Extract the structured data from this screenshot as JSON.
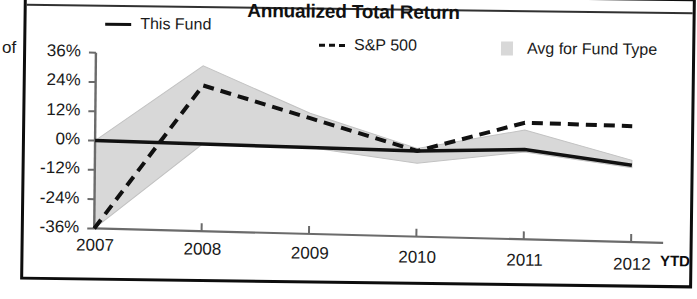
{
  "page": {
    "edge_fragment_text": "of"
  },
  "chart_data": {
    "type": "line",
    "title": "Annualized Total Return",
    "xlabel": "",
    "ylabel": "",
    "grid": false,
    "legend_position": "top",
    "categories": [
      "2007",
      "2008",
      "2009",
      "2010",
      "2011",
      "2012"
    ],
    "x_tick_suffix_label": "YTD",
    "ytick_labels": [
      "36%",
      "24%",
      "12%",
      "0%",
      "-12%",
      "-24%",
      "-36%"
    ],
    "ytick_values": [
      36,
      24,
      12,
      0,
      -12,
      -24,
      -36
    ],
    "ylim": [
      -36,
      36
    ],
    "series": [
      {
        "name": "This Fund",
        "style": "solid",
        "color": "#111111",
        "values": [
          0,
          -1,
          -2,
          -3,
          -2,
          -8
        ]
      },
      {
        "name": "S&P 500",
        "style": "dashed",
        "color": "#111111",
        "values": [
          -36,
          23,
          10,
          -3,
          9,
          8
        ]
      },
      {
        "name": "Avg for Fund Type",
        "style": "band",
        "color": "#d8d8d8",
        "band_upper": [
          0,
          31,
          12,
          -2,
          6,
          -6
        ],
        "band_lower": [
          -36,
          -1,
          -2,
          -8,
          -3,
          -9
        ]
      }
    ]
  },
  "legend": {
    "items": [
      {
        "label": "This Fund",
        "marker": "solid-line-icon"
      },
      {
        "label": "S&P 500",
        "marker": "dashed-line-icon"
      },
      {
        "label": "Avg for Fund Type",
        "marker": "band-swatch-icon"
      }
    ]
  }
}
